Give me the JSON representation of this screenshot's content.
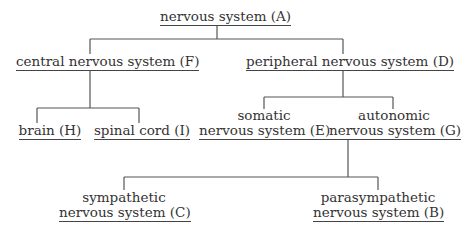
{
  "diagram": {
    "type": "tree",
    "nodes": {
      "A": {
        "label": "nervous system (A)"
      },
      "F": {
        "label": "central nervous system (F)"
      },
      "D": {
        "label": "peripheral nervous system (D)"
      },
      "H": {
        "label": "brain (H)"
      },
      "I": {
        "label": "spinal cord (I)"
      },
      "E": {
        "line1": "somatic",
        "line2": "nervous system (E)"
      },
      "G": {
        "line1": "autonomic",
        "line2": "nervous system (G)"
      },
      "C": {
        "line1": "sympathetic",
        "line2": "nervous system (C)"
      },
      "B": {
        "line1": "parasympathetic",
        "line2": "nervous system (B)"
      }
    },
    "edges": [
      [
        "A",
        "F"
      ],
      [
        "A",
        "D"
      ],
      [
        "F",
        "H"
      ],
      [
        "F",
        "I"
      ],
      [
        "D",
        "E"
      ],
      [
        "D",
        "G"
      ],
      [
        "G",
        "C"
      ],
      [
        "G",
        "B"
      ]
    ],
    "colors": {
      "background": "#ffffff",
      "text": "#333333",
      "line": "#555555"
    }
  }
}
